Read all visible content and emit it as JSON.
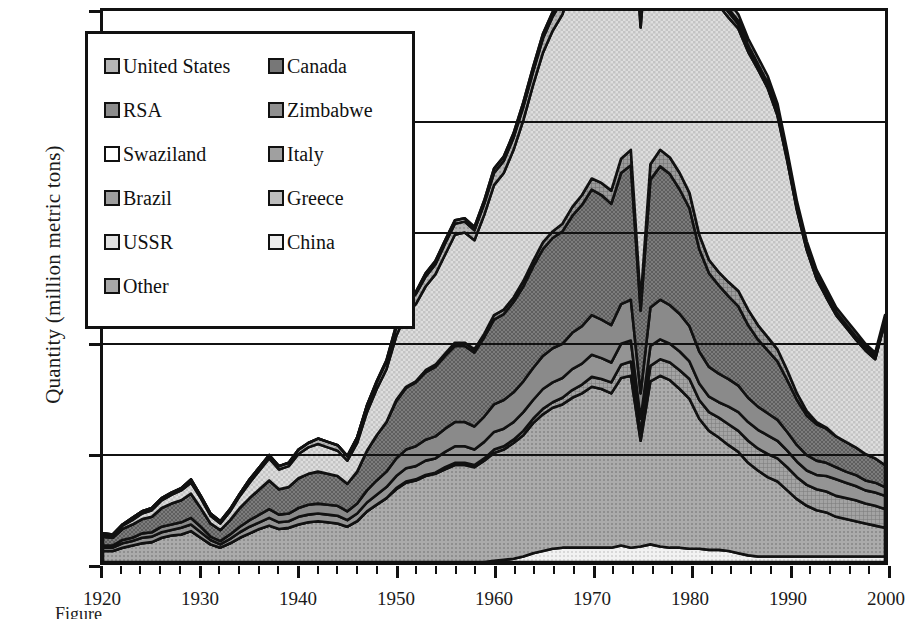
{
  "axes": {
    "ylabel": "Quantity (million metric tons)",
    "yticks": [
      "0",
      "1",
      "2",
      "3",
      "4",
      "5"
    ],
    "ylim": [
      0,
      5
    ],
    "xticks": [
      "1920",
      "1930",
      "1940",
      "1950",
      "1960",
      "1970",
      "1980",
      "1990",
      "2000"
    ],
    "xlim": [
      1920,
      2000
    ],
    "xlabel": ""
  },
  "caption": "Figure",
  "legend": {
    "column_a": [
      {
        "label": "United States",
        "swatch": "sw-us",
        "pattern": "crosshatch-medium"
      },
      {
        "label": "RSA",
        "swatch": "sw-rsa",
        "pattern": "solid-gray"
      },
      {
        "label": "Swaziland",
        "swatch": "sw-swz",
        "pattern": "white"
      },
      {
        "label": "Brazil",
        "swatch": "sw-bra",
        "pattern": "fine-grid"
      },
      {
        "label": "USSR",
        "swatch": "sw-ussr",
        "pattern": "light-check"
      },
      {
        "label": "Other",
        "swatch": "sw-oth",
        "pattern": "dotted-gray"
      }
    ],
    "column_b": [
      {
        "label": "Canada",
        "swatch": "sw-can",
        "pattern": "dark-check"
      },
      {
        "label": "Zimbabwe",
        "swatch": "sw-zim",
        "pattern": "solid-midgray"
      },
      {
        "label": "Italy",
        "swatch": "sw-ita",
        "pattern": "fine-grid-dark"
      },
      {
        "label": "Greece",
        "swatch": "sw-gre",
        "pattern": "diagonal-stripe"
      },
      {
        "label": "China",
        "swatch": "sw-chi",
        "pattern": "light-dot"
      }
    ]
  },
  "chart_data": {
    "type": "area",
    "title": "",
    "xlabel": "",
    "ylabel": "Quantity (million metric tons)",
    "xlim": [
      1920,
      2000
    ],
    "ylim": [
      0,
      5
    ],
    "grid": true,
    "stacked": true,
    "legend_position": "upper-left-inset",
    "x": [
      1920,
      1921,
      1922,
      1923,
      1924,
      1925,
      1926,
      1927,
      1928,
      1929,
      1930,
      1931,
      1932,
      1933,
      1934,
      1935,
      1936,
      1937,
      1938,
      1939,
      1940,
      1941,
      1942,
      1943,
      1944,
      1945,
      1946,
      1947,
      1948,
      1949,
      1950,
      1951,
      1952,
      1953,
      1954,
      1955,
      1956,
      1957,
      1958,
      1959,
      1960,
      1961,
      1962,
      1963,
      1964,
      1965,
      1966,
      1967,
      1968,
      1969,
      1970,
      1971,
      1972,
      1973,
      1974,
      1975,
      1976,
      1977,
      1978,
      1979,
      1980,
      1981,
      1982,
      1983,
      1984,
      1985,
      1986,
      1987,
      1988,
      1989,
      1990,
      1991,
      1992,
      1993,
      1994,
      1995,
      1996,
      1997,
      1998,
      1999,
      2000
    ],
    "series": [
      {
        "name": "China",
        "swatch": "sw-chi",
        "values": [
          0,
          0,
          0,
          0,
          0,
          0,
          0,
          0,
          0,
          0,
          0,
          0,
          0,
          0,
          0,
          0,
          0,
          0,
          0,
          0,
          0,
          0,
          0,
          0,
          0,
          0,
          0,
          0,
          0,
          0,
          0,
          0,
          0,
          0,
          0,
          0,
          0,
          0,
          0,
          0,
          0.01,
          0.02,
          0.03,
          0.05,
          0.08,
          0.1,
          0.12,
          0.13,
          0.13,
          0.13,
          0.13,
          0.13,
          0.13,
          0.15,
          0.13,
          0.14,
          0.16,
          0.14,
          0.13,
          0.13,
          0.12,
          0.12,
          0.11,
          0.11,
          0.1,
          0.08,
          0.06,
          0.05,
          0.05,
          0.05,
          0.05,
          0.05,
          0.05,
          0.05,
          0.05,
          0.05,
          0.05,
          0.05,
          0.05,
          0.05,
          0.05
        ]
      },
      {
        "name": "Other",
        "swatch": "sw-oth",
        "values": [
          0.1,
          0.1,
          0.13,
          0.15,
          0.17,
          0.18,
          0.22,
          0.24,
          0.25,
          0.28,
          0.22,
          0.16,
          0.13,
          0.17,
          0.22,
          0.26,
          0.3,
          0.33,
          0.3,
          0.31,
          0.34,
          0.36,
          0.37,
          0.36,
          0.35,
          0.32,
          0.37,
          0.46,
          0.52,
          0.58,
          0.66,
          0.72,
          0.74,
          0.78,
          0.8,
          0.84,
          0.88,
          0.88,
          0.86,
          0.92,
          0.98,
          1.0,
          1.05,
          1.1,
          1.18,
          1.24,
          1.28,
          1.3,
          1.36,
          1.4,
          1.46,
          1.44,
          1.4,
          1.52,
          1.56,
          0.96,
          1.48,
          1.55,
          1.52,
          1.44,
          1.36,
          1.18,
          1.08,
          1.02,
          0.96,
          0.92,
          0.84,
          0.78,
          0.72,
          0.68,
          0.6,
          0.52,
          0.46,
          0.42,
          0.4,
          0.36,
          0.34,
          0.32,
          0.3,
          0.28,
          0.26
        ]
      },
      {
        "name": "Brazil",
        "swatch": "sw-bra",
        "values": [
          0,
          0,
          0,
          0,
          0,
          0,
          0,
          0,
          0,
          0,
          0,
          0,
          0,
          0,
          0,
          0,
          0,
          0,
          0,
          0,
          0,
          0,
          0,
          0,
          0,
          0,
          0,
          0,
          0,
          0,
          0.01,
          0.01,
          0.01,
          0.01,
          0.01,
          0.02,
          0.02,
          0.02,
          0.02,
          0.02,
          0.03,
          0.03,
          0.03,
          0.04,
          0.04,
          0.05,
          0.05,
          0.06,
          0.07,
          0.08,
          0.09,
          0.09,
          0.1,
          0.12,
          0.13,
          0.08,
          0.14,
          0.15,
          0.16,
          0.17,
          0.18,
          0.17,
          0.17,
          0.18,
          0.19,
          0.19,
          0.2,
          0.2,
          0.21,
          0.21,
          0.21,
          0.2,
          0.19,
          0.19,
          0.19,
          0.19,
          0.19,
          0.19,
          0.18,
          0.18,
          0.17
        ]
      },
      {
        "name": "Zimbabwe",
        "swatch": "sw-zim",
        "values": [
          0.03,
          0.03,
          0.04,
          0.04,
          0.05,
          0.05,
          0.05,
          0.05,
          0.06,
          0.06,
          0.05,
          0.04,
          0.03,
          0.04,
          0.05,
          0.06,
          0.06,
          0.07,
          0.06,
          0.06,
          0.07,
          0.07,
          0.07,
          0.07,
          0.07,
          0.06,
          0.07,
          0.08,
          0.09,
          0.1,
          0.11,
          0.12,
          0.12,
          0.13,
          0.13,
          0.14,
          0.15,
          0.15,
          0.14,
          0.15,
          0.16,
          0.16,
          0.16,
          0.17,
          0.17,
          0.18,
          0.18,
          0.18,
          0.19,
          0.19,
          0.2,
          0.19,
          0.18,
          0.19,
          0.19,
          0.12,
          0.18,
          0.18,
          0.17,
          0.17,
          0.16,
          0.15,
          0.14,
          0.14,
          0.16,
          0.17,
          0.17,
          0.17,
          0.17,
          0.16,
          0.15,
          0.14,
          0.13,
          0.13,
          0.14,
          0.15,
          0.14,
          0.13,
          0.12,
          0.12,
          0.12
        ]
      },
      {
        "name": "RSA",
        "swatch": "sw-rsa",
        "values": [
          0.02,
          0.02,
          0.03,
          0.03,
          0.04,
          0.04,
          0.05,
          0.05,
          0.05,
          0.06,
          0.05,
          0.03,
          0.03,
          0.04,
          0.05,
          0.06,
          0.07,
          0.08,
          0.07,
          0.07,
          0.08,
          0.09,
          0.09,
          0.09,
          0.09,
          0.08,
          0.09,
          0.11,
          0.13,
          0.14,
          0.16,
          0.17,
          0.18,
          0.19,
          0.2,
          0.21,
          0.22,
          0.22,
          0.21,
          0.23,
          0.25,
          0.26,
          0.27,
          0.28,
          0.29,
          0.3,
          0.31,
          0.31,
          0.33,
          0.34,
          0.36,
          0.35,
          0.34,
          0.36,
          0.37,
          0.23,
          0.35,
          0.36,
          0.35,
          0.34,
          0.32,
          0.29,
          0.27,
          0.26,
          0.25,
          0.24,
          0.22,
          0.21,
          0.2,
          0.19,
          0.17,
          0.15,
          0.14,
          0.13,
          0.12,
          0.11,
          0.1,
          0.1,
          0.09,
          0.09,
          0.08
        ]
      },
      {
        "name": "Canada",
        "swatch": "sw-can",
        "values": [
          0.08,
          0.07,
          0.1,
          0.12,
          0.13,
          0.14,
          0.17,
          0.19,
          0.2,
          0.22,
          0.17,
          0.12,
          0.1,
          0.13,
          0.17,
          0.2,
          0.23,
          0.26,
          0.23,
          0.24,
          0.27,
          0.28,
          0.29,
          0.28,
          0.27,
          0.25,
          0.29,
          0.36,
          0.41,
          0.45,
          0.52,
          0.56,
          0.58,
          0.61,
          0.63,
          0.66,
          0.69,
          0.69,
          0.67,
          0.72,
          0.77,
          0.78,
          0.82,
          0.86,
          0.92,
          0.97,
          1.0,
          1.02,
          1.06,
          1.1,
          1.14,
          1.13,
          1.1,
          1.19,
          1.22,
          0.75,
          1.16,
          1.21,
          1.19,
          1.13,
          1.07,
          0.93,
          0.85,
          0.8,
          0.75,
          0.72,
          0.66,
          0.61,
          0.57,
          0.53,
          0.47,
          0.41,
          0.36,
          0.33,
          0.31,
          0.28,
          0.27,
          0.25,
          0.24,
          0.22,
          0.2
        ]
      },
      {
        "name": "Italy",
        "swatch": "sw-ita",
        "values": [
          0,
          0,
          0,
          0,
          0,
          0,
          0,
          0,
          0,
          0,
          0,
          0,
          0,
          0,
          0,
          0,
          0,
          0,
          0,
          0,
          0,
          0,
          0,
          0,
          0,
          0,
          0,
          0,
          0,
          0,
          0.01,
          0.01,
          0.01,
          0.02,
          0.02,
          0.02,
          0.03,
          0.03,
          0.03,
          0.03,
          0.04,
          0.04,
          0.04,
          0.05,
          0.05,
          0.06,
          0.06,
          0.07,
          0.08,
          0.09,
          0.1,
          0.11,
          0.12,
          0.13,
          0.14,
          0.09,
          0.14,
          0.15,
          0.15,
          0.15,
          0.14,
          0.13,
          0.12,
          0.12,
          0.13,
          0.14,
          0.14,
          0.13,
          0.12,
          0.11,
          0.09,
          0.06,
          0.04,
          0.02,
          0.01,
          0,
          0,
          0,
          0,
          0,
          0
        ]
      },
      {
        "name": "USSR",
        "swatch": "sw-ussr",
        "values": [
          0.02,
          0.02,
          0.03,
          0.04,
          0.05,
          0.06,
          0.07,
          0.08,
          0.09,
          0.1,
          0.09,
          0.07,
          0.06,
          0.08,
          0.11,
          0.14,
          0.17,
          0.2,
          0.18,
          0.19,
          0.22,
          0.24,
          0.25,
          0.24,
          0.23,
          0.21,
          0.26,
          0.35,
          0.42,
          0.48,
          0.58,
          0.66,
          0.7,
          0.76,
          0.82,
          0.9,
          0.98,
          1.0,
          0.99,
          1.08,
          1.18,
          1.24,
          1.34,
          1.46,
          1.6,
          1.72,
          1.82,
          1.9,
          2.02,
          2.12,
          2.24,
          2.26,
          2.22,
          2.38,
          2.44,
          2.48,
          2.4,
          2.5,
          2.52,
          2.46,
          2.4,
          2.36,
          2.34,
          2.42,
          2.4,
          2.38,
          2.34,
          2.32,
          2.26,
          2.12,
          1.9,
          1.66,
          1.46,
          1.3,
          1.18,
          1.1,
          1.04,
          0.98,
          0.94,
          0.9,
          1.3
        ]
      },
      {
        "name": "United States",
        "swatch": "sw-us",
        "values": [
          0.01,
          0.01,
          0.01,
          0.02,
          0.02,
          0.02,
          0.02,
          0.02,
          0.02,
          0.03,
          0.02,
          0.02,
          0.02,
          0.02,
          0.02,
          0.03,
          0.03,
          0.03,
          0.03,
          0.03,
          0.04,
          0.04,
          0.05,
          0.05,
          0.05,
          0.04,
          0.05,
          0.06,
          0.06,
          0.07,
          0.08,
          0.09,
          0.09,
          0.09,
          0.09,
          0.1,
          0.1,
          0.1,
          0.09,
          0.1,
          0.11,
          0.11,
          0.11,
          0.12,
          0.12,
          0.13,
          0.13,
          0.13,
          0.13,
          0.14,
          0.14,
          0.13,
          0.12,
          0.13,
          0.13,
          0.08,
          0.12,
          0.12,
          0.11,
          0.1,
          0.09,
          0.07,
          0.06,
          0.05,
          0.05,
          0.04,
          0.03,
          0.02,
          0.02,
          0.02,
          0.02,
          0.01,
          0.01,
          0.01,
          0.01,
          0.01,
          0.01,
          0.01,
          0.01,
          0.01,
          0.01
        ]
      },
      {
        "name": "Swaziland",
        "swatch": "sw-swz",
        "values": [
          0,
          0,
          0,
          0,
          0,
          0,
          0,
          0,
          0,
          0,
          0,
          0,
          0,
          0,
          0,
          0,
          0,
          0,
          0,
          0,
          0,
          0,
          0,
          0,
          0,
          0,
          0,
          0,
          0.01,
          0.01,
          0.02,
          0.02,
          0.02,
          0.03,
          0.03,
          0.03,
          0.03,
          0.03,
          0.03,
          0.03,
          0.04,
          0.04,
          0.04,
          0.04,
          0.04,
          0.04,
          0.04,
          0.04,
          0.04,
          0.04,
          0.04,
          0.04,
          0.04,
          0.04,
          0.04,
          0.03,
          0.04,
          0.04,
          0.04,
          0.04,
          0.04,
          0.03,
          0.03,
          0.03,
          0.03,
          0.03,
          0.03,
          0.03,
          0.03,
          0.03,
          0.02,
          0.02,
          0.02,
          0.02,
          0.02,
          0.02,
          0.02,
          0.02,
          0.02,
          0.02,
          0.02
        ]
      },
      {
        "name": "Greece",
        "swatch": "sw-gre",
        "values": [
          0,
          0,
          0,
          0,
          0,
          0,
          0,
          0,
          0,
          0,
          0,
          0,
          0,
          0,
          0,
          0,
          0,
          0,
          0,
          0,
          0,
          0,
          0,
          0,
          0,
          0,
          0,
          0,
          0,
          0,
          0,
          0,
          0,
          0,
          0,
          0,
          0,
          0,
          0,
          0,
          0,
          0,
          0,
          0,
          0,
          0,
          0,
          0,
          0,
          0,
          0,
          0,
          0,
          0,
          0,
          0,
          0,
          0.01,
          0.02,
          0.03,
          0.04,
          0.05,
          0.05,
          0.06,
          0.06,
          0.06,
          0.06,
          0.06,
          0.06,
          0.06,
          0.05,
          0.05,
          0.05,
          0.05,
          0.05,
          0.04,
          0.04,
          0.04,
          0.03,
          0.03,
          0.03
        ]
      }
    ],
    "totals_note": "Peak total ~4.75 around 1977-1979; decline after 1990",
    "annotations": []
  }
}
